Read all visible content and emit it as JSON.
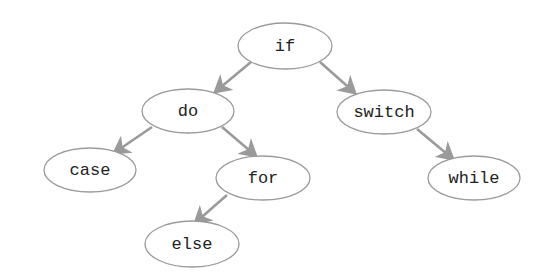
{
  "diagram": {
    "type": "binary-tree",
    "nodes": [
      {
        "id": "if",
        "label": "if",
        "cx": 285,
        "cy": 46,
        "rx": 47,
        "ry": 23
      },
      {
        "id": "do",
        "label": "do",
        "cx": 188,
        "cy": 111,
        "rx": 46,
        "ry": 22
      },
      {
        "id": "switch",
        "label": "switch",
        "cx": 384,
        "cy": 112,
        "rx": 47,
        "ry": 22
      },
      {
        "id": "case",
        "label": "case",
        "cx": 90,
        "cy": 170,
        "rx": 46,
        "ry": 22
      },
      {
        "id": "for",
        "label": "for",
        "cx": 263,
        "cy": 178,
        "rx": 47,
        "ry": 22
      },
      {
        "id": "while",
        "label": "while",
        "cx": 474,
        "cy": 178,
        "rx": 46,
        "ry": 22
      },
      {
        "id": "else",
        "label": "else",
        "cx": 192,
        "cy": 244,
        "rx": 47,
        "ry": 23
      }
    ],
    "edges": [
      {
        "from": "if",
        "to": "do",
        "x1": 251,
        "y1": 62,
        "x2": 215,
        "y2": 92
      },
      {
        "from": "if",
        "to": "switch",
        "x1": 320,
        "y1": 62,
        "x2": 355,
        "y2": 93
      },
      {
        "from": "do",
        "to": "case",
        "x1": 152,
        "y1": 127,
        "x2": 114,
        "y2": 153
      },
      {
        "from": "do",
        "to": "for",
        "x1": 222,
        "y1": 127,
        "x2": 256,
        "y2": 156
      },
      {
        "from": "switch",
        "to": "while",
        "x1": 417,
        "y1": 129,
        "x2": 453,
        "y2": 159
      },
      {
        "from": "for",
        "to": "else",
        "x1": 227,
        "y1": 195,
        "x2": 195,
        "y2": 223
      }
    ]
  }
}
